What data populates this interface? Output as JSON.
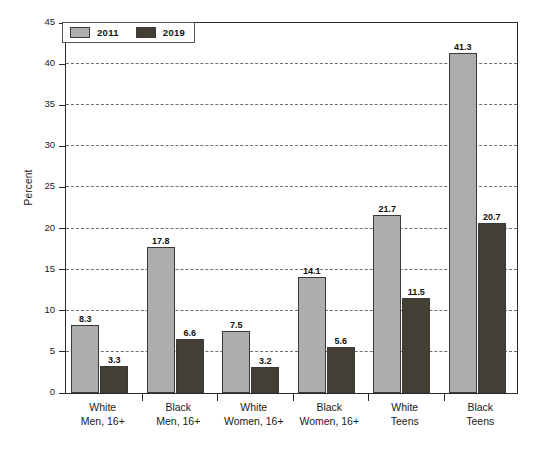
{
  "chart_data": {
    "type": "bar",
    "title": "",
    "xlabel": "",
    "ylabel": "Percent",
    "ylim": [
      0,
      45
    ],
    "ytick_step": 5,
    "yticks": [
      0,
      5,
      10,
      15,
      20,
      25,
      30,
      35,
      40,
      45
    ],
    "ytick_labels": [
      "0",
      "5",
      "10",
      "15",
      "20",
      "25",
      "30",
      "35",
      "40",
      "45"
    ],
    "grid": true,
    "grid_axis": "y",
    "legend_position": "upper-left-inside",
    "categories": [
      "White\nMen, 16+",
      "Black\nMen, 16+",
      "White\nWomen, 16+",
      "Black\nWomen, 16+",
      "White\nTeens",
      "Black\nTeens"
    ],
    "category_lines": [
      [
        "White",
        "Men, 16+"
      ],
      [
        "Black",
        "Men, 16+"
      ],
      [
        "White",
        "Women, 16+"
      ],
      [
        "Black",
        "Women, 16+"
      ],
      [
        "White",
        "Teens"
      ],
      [
        "Black",
        "Teens"
      ]
    ],
    "series": [
      {
        "name": "2011",
        "color": "#adadad",
        "values": [
          8.3,
          17.8,
          7.5,
          14.1,
          21.7,
          41.3
        ],
        "labels": [
          "8.3",
          "17.8",
          "7.5",
          "14.1",
          "21.7",
          "41.3"
        ]
      },
      {
        "name": "2019",
        "color": "#443f34",
        "values": [
          3.3,
          6.6,
          3.2,
          5.6,
          11.5,
          20.7
        ],
        "labels": [
          "3.3",
          "6.6",
          "3.2",
          "5.6",
          "11.5",
          "20.7"
        ]
      }
    ]
  },
  "legend": {
    "items": [
      {
        "label": "2011",
        "color": "#adadad"
      },
      {
        "label": "2019",
        "color": "#443f34"
      }
    ]
  },
  "axis": {
    "y_title": "Percent"
  }
}
